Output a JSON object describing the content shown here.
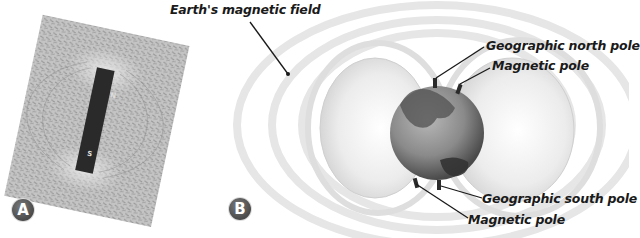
{
  "figure": {
    "panel_a": {
      "badge": "A",
      "subject": "bar magnet with iron filings",
      "magnet_labels": {
        "north": "N",
        "south": "S"
      }
    },
    "panel_b": {
      "badge": "B",
      "labels": {
        "field": "Earth's magnetic field",
        "geo_north": "Geographic north pole",
        "mag_north": "Magnetic pole",
        "geo_south": "Geographic south pole",
        "mag_south": "Magnetic pole"
      }
    }
  },
  "colors": {
    "background": "#ffffff",
    "text": "#1a1a1a",
    "badge": "#555555",
    "magnet": "#2a2a2a",
    "filings_bg": "#bdbdbd"
  }
}
